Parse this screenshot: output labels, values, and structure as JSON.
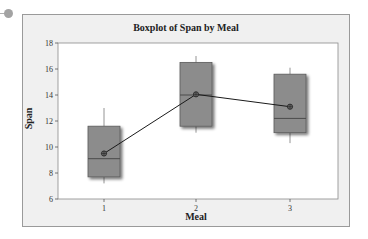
{
  "chart_data": {
    "type": "boxplot",
    "title": "Boxplot of Span by Meal",
    "xlabel": "Meal",
    "ylabel": "Span",
    "categories": [
      "1",
      "2",
      "3"
    ],
    "ylim": [
      6,
      18
    ],
    "yticks": [
      6,
      8,
      10,
      12,
      14,
      16,
      18
    ],
    "boxes": [
      {
        "category": "1",
        "whisker_low": 7.2,
        "q1": 7.7,
        "median": 9.1,
        "q3": 11.6,
        "whisker_high": 13.0,
        "mean": 9.5
      },
      {
        "category": "2",
        "whisker_low": 11.1,
        "q1": 11.6,
        "median": 14.0,
        "q3": 16.5,
        "whisker_high": 17.0,
        "mean": 14.05
      },
      {
        "category": "3",
        "whisker_low": 10.3,
        "q1": 11.1,
        "median": 12.2,
        "q3": 15.6,
        "whisker_high": 16.1,
        "mean": 13.1
      }
    ],
    "mean_connect_line": true,
    "grid": false,
    "legend": null,
    "colors": {
      "box_fill": "#8c8c8c",
      "box_edge": "#5a5a5a",
      "line": "#1a1a1a",
      "plot_bg": "#ffffff",
      "frame_bg": "#f0f0f0"
    }
  }
}
